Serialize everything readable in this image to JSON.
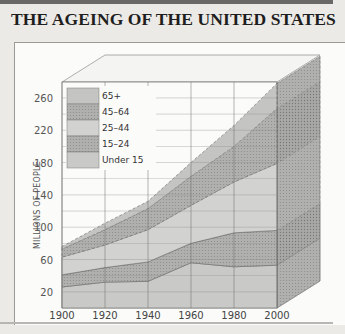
{
  "title": "THE AGEING OF THE UNITED STATES",
  "chart_data": {
    "type": "area",
    "stacked": true,
    "style": "3d-box",
    "title": "THE AGEING OF THE UNITED STATES",
    "xlabel": "",
    "ylabel": "MILLIONS OF PEOPLE",
    "x": [
      1900,
      1920,
      1940,
      1960,
      1980,
      2000
    ],
    "x_tick_labels": [
      "1900",
      "1920",
      "1940",
      "1960",
      "1980",
      "2000"
    ],
    "y_tick_labels": [
      "20",
      "60",
      "100",
      "140",
      "180",
      "220",
      "260"
    ],
    "ylim": [
      0,
      280
    ],
    "grid": true,
    "legend_position": "upper-left-inside",
    "series": [
      {
        "name": "Under 15",
        "values": [
          26,
          32,
          33,
          56,
          51,
          53
        ],
        "color": "#c9c9c7"
      },
      {
        "name": "15–24",
        "values": [
          15,
          18,
          24,
          24,
          42,
          43
        ],
        "color": "#b2b2b0"
      },
      {
        "name": "25–44",
        "values": [
          22,
          28,
          40,
          47,
          63,
          83
        ],
        "color": "#d2d2d0"
      },
      {
        "name": "45–64",
        "values": [
          10,
          19,
          26,
          36,
          44,
          68
        ],
        "color": "#b9b9b7"
      },
      {
        "name": "65+",
        "values": [
          3,
          8,
          9,
          17,
          26,
          31
        ],
        "color": "#c4c4c2"
      }
    ]
  },
  "legend": [
    {
      "label": "65+"
    },
    {
      "label": "45–64"
    },
    {
      "label": "25–44"
    },
    {
      "label": "15–24"
    },
    {
      "label": "Under 15"
    }
  ]
}
